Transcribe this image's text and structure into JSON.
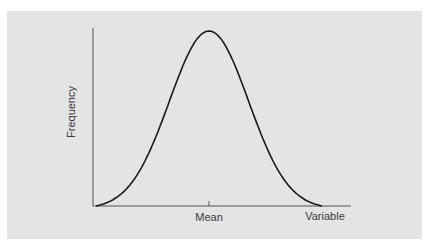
{
  "chart_data": {
    "type": "line",
    "title": "",
    "xlabel": "Variable",
    "ylabel": "Frequency",
    "x_tick_labels": [
      "Mean"
    ],
    "series": [
      {
        "name": "Normal distribution",
        "x": [
          -3,
          -2.5,
          -2,
          -1.5,
          -1,
          -0.5,
          0,
          0.5,
          1,
          1.5,
          2,
          2.5,
          3
        ],
        "values": [
          0.0,
          0.04,
          0.13,
          0.32,
          0.6,
          0.88,
          1.0,
          0.88,
          0.6,
          0.32,
          0.13,
          0.04,
          0.0
        ]
      }
    ],
    "grid": false,
    "legend": false,
    "colors": {
      "background": "#e4e4e4",
      "line": "#1a1a1a",
      "axis": "#555555"
    }
  },
  "labels": {
    "y_axis": "Frequency",
    "x_axis": "Variable",
    "mean_tick": "Mean"
  }
}
